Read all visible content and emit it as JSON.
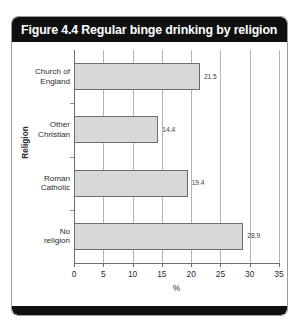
{
  "figure": {
    "title": "Figure 4.4 Regular binge drinking by religion",
    "title_bar_color": "#101010",
    "bar_fill_color": "#d8d8d8",
    "bar_border_color": "#6d6d6d"
  },
  "chart_data": {
    "type": "bar",
    "orientation": "horizontal",
    "title": "Figure 4.4 Regular binge drinking by religion",
    "categories": [
      "Church of England",
      "Other Christian",
      "Roman Catholic",
      "No religion"
    ],
    "category_lines": [
      [
        "Church of",
        "England"
      ],
      [
        "Other",
        "Christian"
      ],
      [
        "Roman",
        "Catholic"
      ],
      [
        "No",
        "religion"
      ]
    ],
    "values": [
      21.5,
      14.4,
      19.4,
      28.9
    ],
    "value_labels": [
      "21.5",
      "14.4",
      "19.4",
      "28.9"
    ],
    "xlabel": "%",
    "ylabel": "Religion",
    "xlim": [
      0,
      35
    ],
    "xticks": [
      0,
      5,
      10,
      15,
      20,
      25,
      30,
      35
    ],
    "xtick_labels": [
      "0",
      "5",
      "10",
      "15",
      "20",
      "25",
      "30",
      "35"
    ],
    "grid": "vertical",
    "legend": null
  }
}
